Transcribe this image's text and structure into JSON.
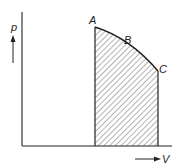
{
  "diagram": {
    "type": "p-V diagram",
    "axes": {
      "y_label": "p",
      "x_label": "V"
    },
    "points": [
      {
        "name": "A",
        "label": "A"
      },
      {
        "name": "B",
        "label": "B"
      },
      {
        "name": "C",
        "label": "C"
      }
    ],
    "shaded_region": "area under curve ABC",
    "colors": {
      "line": "#222222",
      "hatch": "#444444",
      "background": "#ffffff"
    }
  }
}
